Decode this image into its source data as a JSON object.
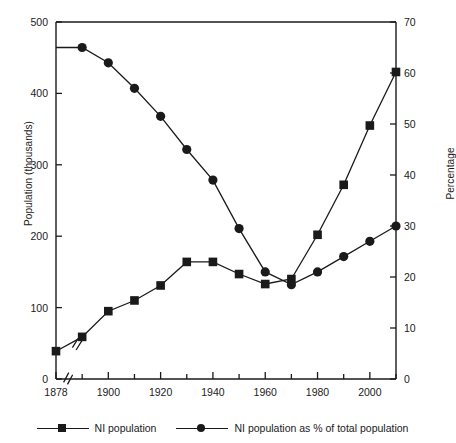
{
  "chart_data": {
    "type": "line",
    "title": "",
    "xlabel": "",
    "ylabel": "Population (thousands)",
    "ylabel_right": "Percentage",
    "grid": false,
    "legend_position": "bottom",
    "x_axis": {
      "tick_labels": [
        "1878",
        "1900",
        "1920",
        "1940",
        "1960",
        "1980",
        "2000"
      ],
      "tick_values": [
        1878,
        1900,
        1920,
        1940,
        1960,
        1980,
        2000
      ],
      "minor_tick_values": [
        1890,
        1910,
        1930,
        1950,
        1970,
        1990,
        2010
      ],
      "range": [
        1878,
        2011
      ],
      "axis_break": true,
      "axis_break_after": 1878
    },
    "y_axis_left": {
      "label": "Population (thousands)",
      "tick_labels": [
        "0",
        "100",
        "200",
        "300",
        "400",
        "500"
      ],
      "tick_values": [
        0,
        100,
        200,
        300,
        400,
        500
      ],
      "range": [
        0,
        500
      ],
      "axis_break": true
    },
    "y_axis_right": {
      "label": "Percentage",
      "tick_labels": [
        "0",
        "10",
        "20",
        "30",
        "40",
        "50",
        "60",
        "70"
      ],
      "tick_values": [
        0,
        10,
        20,
        30,
        40,
        50,
        60,
        70
      ],
      "range": [
        0,
        70
      ]
    },
    "x": [
      1878,
      1890,
      1900,
      1910,
      1920,
      1930,
      1940,
      1950,
      1960,
      1970,
      1980,
      1990,
      2000,
      2011
    ],
    "series": [
      {
        "name": "NI population",
        "marker": "square",
        "axis": "left",
        "units": "thousands",
        "values": [
          39,
          59,
          95,
          110,
          131,
          164,
          164,
          147,
          133,
          140,
          202,
          272,
          355,
          430
        ]
      },
      {
        "name": "NI population as % of total population",
        "marker": "circle",
        "axis": "right",
        "units": "percent",
        "values": [
          65,
          65,
          62,
          57,
          51.5,
          45,
          39,
          29.5,
          21,
          18.5,
          21,
          24,
          27,
          30
        ]
      }
    ]
  },
  "legend": {
    "items": [
      {
        "label": "NI population",
        "marker": "square"
      },
      {
        "label": "NI population as % of total population",
        "marker": "circle"
      }
    ]
  },
  "colors": {
    "line": "#1a1a1a",
    "marker": "#1a1a1a",
    "axis": "#1a1a1a",
    "background": "#ffffff"
  }
}
